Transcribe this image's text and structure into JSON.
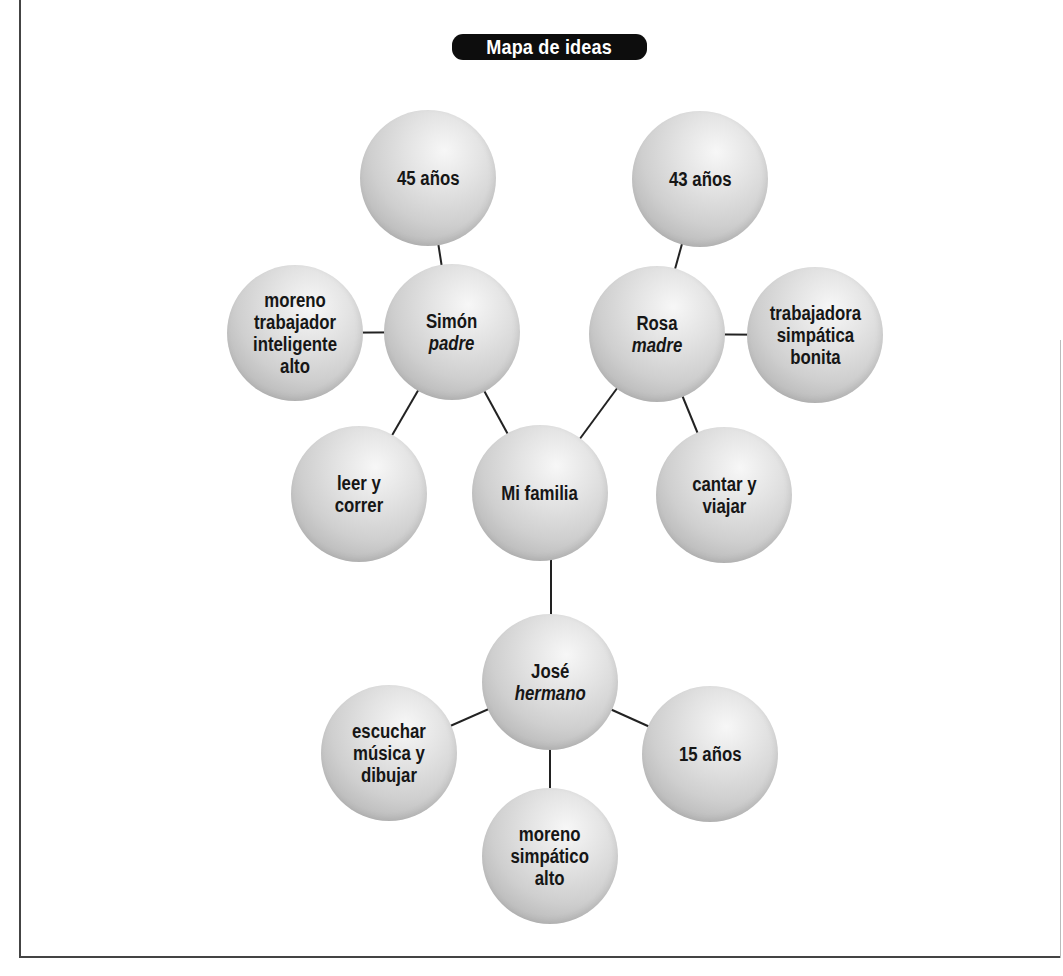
{
  "title": "Mapa de ideas",
  "colors": {
    "pill_background": "#0d0d0d",
    "pill_text": "#ffffff",
    "node_light": "#f7f7f7",
    "node_dark": "#9d9d9d",
    "node_text": "#161616",
    "link_color": "#222222",
    "frame_color": "#444444"
  },
  "center": {
    "id": "mi-familia",
    "lines": [
      "Mi familia"
    ]
  },
  "members": {
    "padre": {
      "name": "Simón",
      "role": "padre",
      "details": {
        "age": [
          "45 años"
        ],
        "description": [
          "moreno",
          "trabajador",
          "inteligente",
          "alto"
        ],
        "hobbies": [
          "leer y",
          "correr"
        ]
      }
    },
    "madre": {
      "name": "Rosa",
      "role": "madre",
      "details": {
        "age": [
          "43 años"
        ],
        "description": [
          "trabajadora",
          "simpática",
          "bonita"
        ],
        "hobbies": [
          "cantar y",
          "viajar"
        ]
      }
    },
    "hermano": {
      "name": "José",
      "role": "hermano",
      "details": {
        "age": [
          "15 años"
        ],
        "description": [
          "moreno",
          "simpático",
          "alto"
        ],
        "hobbies": [
          "escuchar",
          "música y",
          "dibujar"
        ]
      }
    }
  },
  "links": [
    [
      "mi-familia",
      "padre"
    ],
    [
      "mi-familia",
      "madre"
    ],
    [
      "mi-familia",
      "hermano"
    ],
    [
      "padre",
      "padre-age"
    ],
    [
      "padre",
      "padre-desc"
    ],
    [
      "padre",
      "padre-hobbies"
    ],
    [
      "madre",
      "madre-age"
    ],
    [
      "madre",
      "madre-desc"
    ],
    [
      "madre",
      "madre-hobbies"
    ],
    [
      "hermano",
      "hermano-age"
    ],
    [
      "hermano",
      "hermano-desc"
    ],
    [
      "hermano",
      "hermano-hobbies"
    ]
  ]
}
